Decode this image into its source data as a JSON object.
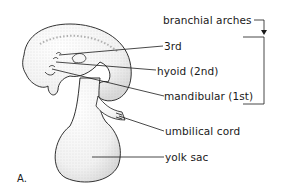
{
  "figure": {
    "panel_label": "A.",
    "labels": {
      "branchial_arches": "branchial arches",
      "third": "3rd",
      "hyoid": "hyoid (2nd)",
      "mandibular": "mandibular (1st)",
      "umbilical_cord": "umbilical cord",
      "yolk_sac": "yolk sac"
    },
    "colors": {
      "ink": "#1a1a1a",
      "stipple": "#bdbdbd",
      "background": "#ffffff"
    }
  }
}
